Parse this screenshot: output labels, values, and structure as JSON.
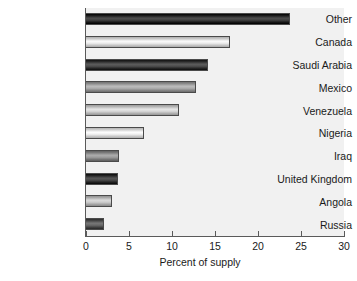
{
  "chart_data": {
    "type": "bar",
    "orientation": "horizontal",
    "title": "",
    "xlabel": "Percent of supply",
    "ylabel": "",
    "xlim": [
      0,
      30
    ],
    "xticks": [
      0,
      5,
      10,
      15,
      20,
      25,
      30
    ],
    "grid": false,
    "legend": false,
    "categories": [
      "Other",
      "Canada",
      "Saudi Arabia",
      "Mexico",
      "Venezuela",
      "Nigeria",
      "Iraq",
      "United Kingdom",
      "Angola",
      "Russia"
    ],
    "values": [
      23.7,
      16.8,
      14.2,
      12.8,
      10.8,
      6.8,
      3.8,
      3.7,
      3.0,
      2.1
    ],
    "bar_colors": [
      "#2b2b2b",
      "#d8d8d8",
      "#3a3a3a",
      "#9a9a9a",
      "#c4c4c4",
      "#dcdcdc",
      "#8a8a8a",
      "#343434",
      "#b8b8b8",
      "#555555"
    ]
  },
  "style": {
    "plot_background": "#f1f1f1",
    "page_background": "#ffffff",
    "axis_color": "#5a5a5a",
    "text_color": "#1a1a1a"
  }
}
